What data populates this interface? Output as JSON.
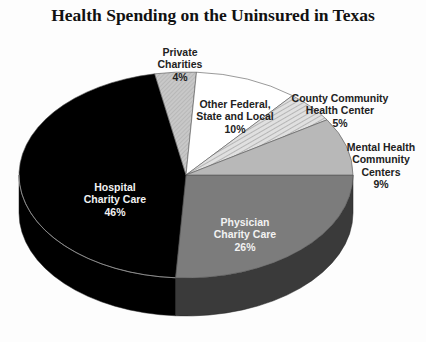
{
  "chart_data": {
    "type": "pie",
    "title": "Health Spending on the Uninsured in Texas",
    "style": "3d",
    "legend": "none (labels placed on/near slices)",
    "categories": [
      "Hospital Charity Care",
      "Physician Charity Care",
      "Mental Health Community Centers",
      "County Community Health Center",
      "Other Federal, State and Local",
      "Private Charities"
    ],
    "values": [
      46,
      26,
      9,
      5,
      10,
      4
    ],
    "unit": "%",
    "colors": [
      "#000000",
      "#7a7a7a",
      "#b5b5b5",
      "#d2d2d2",
      "#ffffff",
      "#c4c4c4"
    ],
    "side_colors": [
      "#000000",
      "#3a3a3a",
      "#555555",
      "#777777",
      "#cccccc",
      "#999999"
    ]
  },
  "labels": [
    {
      "name": "Hospital\nCharity Care",
      "pct": "46%"
    },
    {
      "name": "Physician\nCharity Care",
      "pct": "26%"
    },
    {
      "name": "Mental Health\nCommunity\nCenters",
      "pct": "9%"
    },
    {
      "name": "County Community\nHealth  Center",
      "pct": "5%"
    },
    {
      "name": "Other  Federal,\nState and Local",
      "pct": "10%"
    },
    {
      "name": "Private\nCharities",
      "pct": "4%"
    }
  ],
  "title_text": "Health Spending on the Uninsured in Texas"
}
